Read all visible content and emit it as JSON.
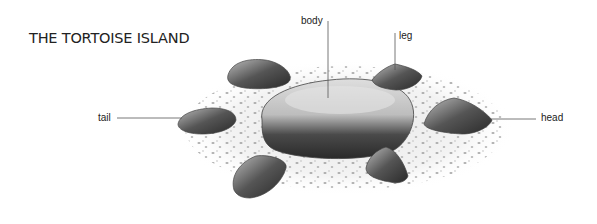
{
  "diagram": {
    "title": "THE TORTOISE ISLAND",
    "labels": {
      "body": "body",
      "leg": "leg",
      "tail": "tail",
      "head": "head"
    },
    "colors": {
      "text": "#222222",
      "leader_line": "#555555",
      "rock_dark": "#2e2e2e",
      "rock_mid": "#7a7a7a",
      "rock_light": "#cfcfcf",
      "gravel": "#9a9a9a"
    }
  }
}
